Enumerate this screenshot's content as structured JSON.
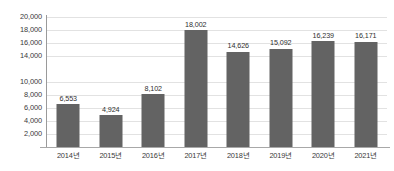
{
  "chart_data": {
    "type": "bar",
    "title": "",
    "subtitle": "",
    "xlabel": "",
    "ylabel": "",
    "categories": [
      "2014년",
      "2015년",
      "2016년",
      "2017년",
      "2018년",
      "2019년",
      "2020년",
      "2021년"
    ],
    "values": [
      6553,
      4924,
      8102,
      18002,
      14626,
      15092,
      16239,
      16171
    ],
    "value_labels": [
      "6,553",
      "4,924",
      "8,102",
      "18,002",
      "14,626",
      "15,092",
      "16,239",
      "16,171"
    ],
    "ylim": [
      0,
      20000
    ],
    "y_ticks": [
      20000,
      18000,
      16000,
      14000,
      10000,
      8000,
      6000,
      4000,
      2000
    ],
    "y_tick_labels": [
      "20,000",
      "18,000",
      "16,000",
      "14,000",
      "10,000",
      "8,000",
      "6,000",
      "4,000",
      "2,000"
    ],
    "grid": true,
    "legend": false,
    "legend_position": "none",
    "bar_color": "#636363",
    "gridline_color": "#e2e2e2",
    "axis_color": "#9a9a9a",
    "text_color": "#3a3a3a",
    "background_color": "#ffffff"
  }
}
